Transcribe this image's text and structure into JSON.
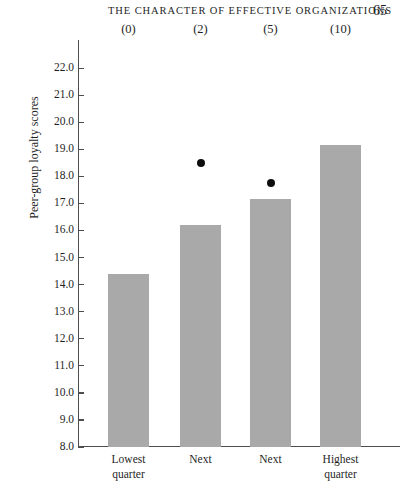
{
  "running_head": {
    "title": "THE CHARACTER OF EFFECTIVE ORGANIZATIONS",
    "page_number": "65"
  },
  "chart_data": {
    "type": "bar",
    "title": "",
    "subtitle": "",
    "xlabel": "",
    "ylabel": "Peer-group loyalty scores",
    "ylim": [
      8.0,
      22.0
    ],
    "ytick_step": 1.0,
    "grid": false,
    "legend": null,
    "categories": [
      "Lowest quarter",
      "Next",
      "Next",
      "Highest quarter"
    ],
    "category_lines": [
      [
        "Lowest",
        "quarter"
      ],
      [
        "Next",
        ""
      ],
      [
        "Next",
        ""
      ],
      [
        "Highest",
        "quarter"
      ]
    ],
    "top_annotations": [
      "(0)",
      "(2)",
      "(5)",
      "(10)"
    ],
    "values": [
      14.4,
      16.2,
      17.15,
      19.15
    ],
    "bar_color": "#a9a9a9",
    "ytick_labels": [
      "22.0",
      "21.0",
      "20.0",
      "19.0",
      "18.0",
      "17.0",
      "16.0",
      "15.0",
      "14.0",
      "13.0",
      "12.0",
      "11.0",
      "10.0",
      "9.0",
      "8.0"
    ],
    "ytick_values": [
      22.0,
      21.0,
      20.0,
      19.0,
      18.0,
      17.0,
      16.0,
      15.0,
      14.0,
      13.0,
      12.0,
      11.0,
      10.0,
      9.0,
      8.0
    ],
    "series": [
      {
        "name": "Peer-group loyalty score",
        "type": "bar",
        "values": [
          14.4,
          16.2,
          17.15,
          19.15
        ]
      },
      {
        "name": "Point marker",
        "type": "scatter",
        "marker_color": "#0d0d0d",
        "points": [
          {
            "category_index": 1,
            "value": 18.5
          },
          {
            "category_index": 2,
            "value": 17.75
          }
        ]
      }
    ]
  }
}
